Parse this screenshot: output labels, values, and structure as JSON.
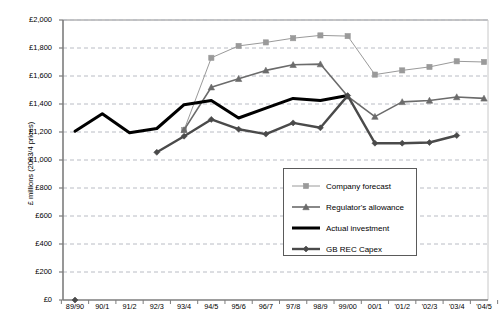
{
  "chart_data": {
    "type": "line",
    "title": "",
    "xlabel": "",
    "ylabel": "£ millions (2003/4 prices)",
    "ylim": [
      0,
      2000
    ],
    "ytick_step": 200,
    "grid": true,
    "legend_position": "center-right-inside",
    "categories": [
      "89/90",
      "90/1",
      "91/2",
      "92/3",
      "93/4",
      "94/5",
      "95/6",
      "96/7",
      "97/8",
      "98/9",
      "99/00",
      "00/1",
      "'01/2",
      "'02/3",
      "'03/4",
      "'04/5"
    ],
    "ytick_labels": [
      "£0",
      "£200",
      "£400",
      "£600",
      "£800",
      "£1,000",
      "£1,200",
      "£1,400",
      "£1,600",
      "£1,800",
      "£2,000"
    ],
    "ytick_values": [
      0,
      200,
      400,
      600,
      800,
      1000,
      1200,
      1400,
      1600,
      1800,
      2000
    ],
    "series": [
      {
        "name": "Company forecast",
        "color": "#9a9a9a",
        "marker": "square",
        "line_width": 1,
        "values": [
          null,
          null,
          null,
          null,
          1215,
          1730,
          1815,
          1840,
          1870,
          1890,
          1885,
          1610,
          1640,
          1665,
          1705,
          1700
        ]
      },
      {
        "name": "Regulator's allowance",
        "color": "#6b6b6b",
        "marker": "triangle",
        "line_width": 1.6,
        "values": [
          null,
          null,
          null,
          null,
          1215,
          1520,
          1580,
          1640,
          1680,
          1685,
          1455,
          1310,
          1415,
          1425,
          1450,
          1440
        ]
      },
      {
        "name": "Actual investment",
        "color": "#000000",
        "marker": "none",
        "line_width": 3,
        "values": [
          1205,
          1330,
          1195,
          1225,
          1395,
          1425,
          1300,
          1370,
          1440,
          1425,
          1460,
          null,
          null,
          null,
          null,
          null
        ]
      },
      {
        "name": "GB REC Capex",
        "color": "#4a4a4a",
        "marker": "diamond",
        "line_width": 2.4,
        "values": [
          null,
          null,
          null,
          1055,
          1170,
          1290,
          1220,
          1185,
          1265,
          1230,
          1460,
          1120,
          1120,
          1125,
          1175,
          null
        ]
      }
    ],
    "zero_marker": {
      "category": "89/90",
      "value": 0,
      "shape": "diamond",
      "color": "#4a4a4a"
    }
  },
  "axis": {
    "y_title": "£ millions (2003/4 prices)"
  },
  "legend": {
    "entries": [
      {
        "label": "Company forecast",
        "color": "#9a9a9a",
        "marker": "square"
      },
      {
        "label": "Regulator's allowance",
        "color": "#6b6b6b",
        "marker": "triangle"
      },
      {
        "label": "Actual investment",
        "color": "#000000",
        "marker": "none"
      },
      {
        "label": "GB REC Capex",
        "color": "#4a4a4a",
        "marker": "diamond"
      }
    ]
  }
}
